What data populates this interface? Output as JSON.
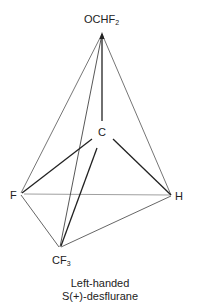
{
  "figure": {
    "atoms": {
      "apex": {
        "symbol": "OCHF",
        "subscript": "2",
        "x": 102,
        "y": 32
      },
      "center": {
        "symbol": "C",
        "subscript": "",
        "x": 102,
        "y": 131
      },
      "left": {
        "symbol": "F",
        "subscript": "",
        "x": 20,
        "y": 194
      },
      "right": {
        "symbol": "H",
        "subscript": "",
        "x": 172,
        "y": 196
      },
      "bottom": {
        "symbol": "CF",
        "subscript": "3",
        "x": 60,
        "y": 248
      }
    },
    "colors": {
      "front_edge": "#333333",
      "back_edge": "#9a9a9a",
      "bond": "#222222"
    }
  },
  "caption": {
    "line1": "Left-handed",
    "line2": "S(+)-desflurane"
  }
}
